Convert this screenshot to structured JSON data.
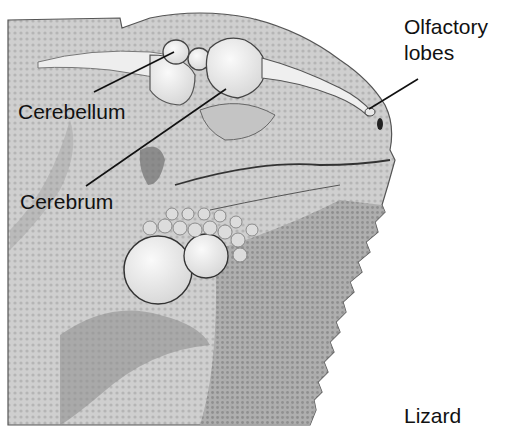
{
  "diagram": {
    "title": "Lizard",
    "labels": {
      "cerebellum": "Cerebellum",
      "cerebrum": "Cerebrum",
      "olfactory_line1": "Olfactory",
      "olfactory_line2": "lobes",
      "caption": "Lizard"
    },
    "structures": [
      {
        "name": "Cerebellum",
        "points_to": "small rounded lobe behind cerebrum"
      },
      {
        "name": "Cerebrum",
        "points_to": "large rounded lobe"
      },
      {
        "name": "Olfactory lobes",
        "points_to": "tip of olfactory tract near nostril"
      }
    ],
    "colors": {
      "background": "#ffffff",
      "skin_light": "#d9d9d9",
      "skin_mid": "#b8b8b8",
      "skin_dark": "#7a7a7a",
      "brain": "#efefef",
      "outline": "#333333",
      "text": "#111111"
    }
  }
}
